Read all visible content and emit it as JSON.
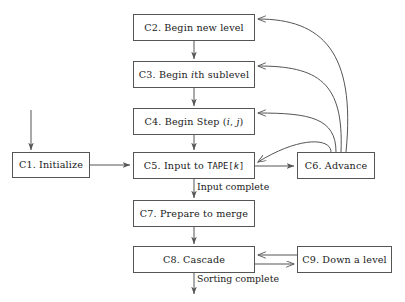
{
  "diagram": {
    "stroke_color": "#555555",
    "text_color": "#1a1a1a",
    "background": "#ffffff",
    "nodes": [
      {
        "id": "C1",
        "label": "C1. Initialize",
        "prefix": "C1. Initialize",
        "x": 12,
        "y": 152,
        "w": 78,
        "h": 26
      },
      {
        "id": "C2",
        "label": "C2. Begin new level",
        "prefix": "C2. Begin new level",
        "x": 133,
        "y": 14,
        "w": 122,
        "h": 27
      },
      {
        "id": "C3",
        "label": "C3. Begin ith sublevel",
        "prefix": "C3. Begin ",
        "italic": "i",
        "suffix": "th sublevel",
        "x": 133,
        "y": 61,
        "w": 122,
        "h": 27
      },
      {
        "id": "C4",
        "label": "C4. Begin Step (i, j)",
        "prefix": "C4. Begin Step (",
        "italic": "i",
        "mid": ", ",
        "italic2": "j",
        "suffix": ")",
        "x": 133,
        "y": 108,
        "w": 122,
        "h": 27
      },
      {
        "id": "C5",
        "label": "C5. Input to TAPE[k]",
        "prefix": "C5. Input to ",
        "mono": "TAPE[",
        "italic": "k",
        "mono2": "]",
        "x": 133,
        "y": 152,
        "w": 122,
        "h": 27
      },
      {
        "id": "C6",
        "label": "C6. Advance",
        "prefix": "C6. Advance",
        "x": 297,
        "y": 152,
        "w": 78,
        "h": 27
      },
      {
        "id": "C7",
        "label": "C7. Prepare to merge",
        "prefix": "C7. Prepare to merge",
        "x": 133,
        "y": 200,
        "w": 122,
        "h": 27
      },
      {
        "id": "C8",
        "label": "C8. Cascade",
        "prefix": "C8. Cascade",
        "x": 133,
        "y": 246,
        "w": 122,
        "h": 27
      },
      {
        "id": "C9",
        "label": "C9. Down a level",
        "prefix": "C9. Down a level",
        "x": 297,
        "y": 246,
        "w": 95,
        "h": 27
      }
    ],
    "edge_labels": [
      {
        "id": "input-complete",
        "text": "Input complete",
        "x": 197,
        "y": 181
      },
      {
        "id": "sorting-complete",
        "text": "Sorting complete",
        "x": 197,
        "y": 273
      }
    ]
  }
}
